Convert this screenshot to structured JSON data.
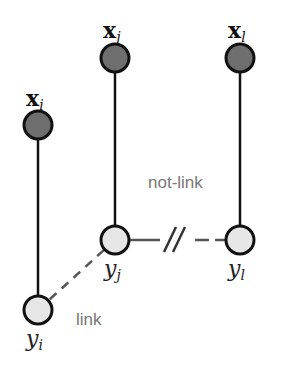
{
  "diagram": {
    "colors": {
      "observed_fill": "#6e6e6e",
      "latent_fill": "#e6e6e6",
      "stroke": "#111111",
      "dashed": "#555555",
      "edge_text": "#777777",
      "background": "#ffffff"
    },
    "nodes": [
      {
        "id": "x_i",
        "type": "observed",
        "base": "x",
        "sub": "i",
        "cx": 38,
        "cy": 125
      },
      {
        "id": "x_j",
        "type": "observed",
        "base": "x",
        "sub": "j",
        "cx": 115,
        "cy": 58
      },
      {
        "id": "x_l",
        "type": "observed",
        "base": "x",
        "sub": "l",
        "cx": 240,
        "cy": 58
      },
      {
        "id": "y_j",
        "type": "latent",
        "base": "y",
        "sub": "j",
        "cx": 115,
        "cy": 240
      },
      {
        "id": "y_l",
        "type": "latent",
        "base": "y",
        "sub": "l",
        "cx": 240,
        "cy": 240
      },
      {
        "id": "y_i",
        "type": "latent",
        "base": "y",
        "sub": "i",
        "cx": 38,
        "cy": 310
      }
    ],
    "edges": [
      {
        "from": "x_i",
        "to": "y_i",
        "style": "solid"
      },
      {
        "from": "x_j",
        "to": "y_j",
        "style": "solid"
      },
      {
        "from": "x_l",
        "to": "y_l",
        "style": "solid"
      },
      {
        "from": "y_i",
        "to": "y_j",
        "style": "dashed",
        "label": "link"
      },
      {
        "from": "y_j",
        "to": "y_l",
        "style": "dashed-broken",
        "label": "not-link"
      }
    ],
    "labels": {
      "link": "link",
      "not_link": "not-link",
      "x_i_base": "x",
      "x_i_sub": "i",
      "x_j_base": "x",
      "x_j_sub": "j",
      "x_l_base": "x",
      "x_l_sub": "l",
      "y_i_base": "y",
      "y_i_sub": "i",
      "y_j_base": "y",
      "y_j_sub": "j",
      "y_l_base": "y",
      "y_l_sub": "l"
    }
  }
}
